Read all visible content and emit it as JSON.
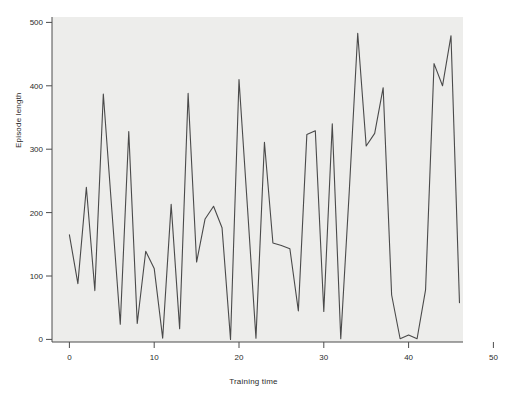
{
  "chart_data": {
    "type": "line",
    "title": "",
    "xlabel": "Training time",
    "ylabel": "Episode length",
    "xlim": [
      -2,
      50
    ],
    "ylim": [
      -18,
      512
    ],
    "xticks": [
      0,
      10,
      20,
      30,
      40,
      50
    ],
    "yticks": [
      0,
      100,
      200,
      300,
      400,
      500
    ],
    "grid": false,
    "legend": false,
    "line_color": "#4a4a4a",
    "panel_color": "#ededeb",
    "figure_color": "#ffffff",
    "series": [
      {
        "name": "Episode length",
        "x": [
          0,
          1,
          2,
          3,
          4,
          5,
          6,
          7,
          8,
          9,
          10,
          11,
          12,
          13,
          14,
          15,
          16,
          17,
          18,
          19,
          20,
          21,
          22,
          23,
          24,
          25,
          26,
          27,
          28,
          29,
          30,
          31,
          32,
          33,
          34,
          35,
          36,
          37,
          38,
          39,
          40,
          41,
          42,
          43,
          44,
          45,
          46
        ],
        "values": [
          165,
          88,
          240,
          77,
          387,
          205,
          24,
          328,
          25,
          139,
          112,
          2,
          213,
          17,
          388,
          122,
          190,
          210,
          176,
          0,
          410,
          208,
          2,
          311,
          152,
          148,
          143,
          45,
          323,
          329,
          44,
          340,
          1,
          233,
          483,
          305,
          325,
          397,
          70,
          1,
          7,
          1,
          78,
          435,
          400,
          479,
          58
        ]
      }
    ]
  },
  "axis": {
    "x_tick_labels": [
      "0",
      "10",
      "20",
      "30",
      "40",
      "50"
    ],
    "y_tick_labels": [
      "0",
      "100",
      "200",
      "300",
      "400",
      "500"
    ]
  }
}
